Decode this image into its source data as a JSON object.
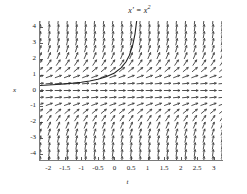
{
  "figure": {
    "title": "x' = x",
    "title_exponent": "2",
    "xlabel": "t",
    "ylabel": "x",
    "background_color": "#ffffff",
    "axis_color": "#7a7a7a",
    "arrow_color": "#3c3c3c",
    "curve_color": "#222222"
  },
  "chart_data": {
    "type": "line",
    "xlabel": "t",
    "ylabel": "x",
    "plot_kind": "direction-field-with-solution-curve",
    "equation": "x' = x^2",
    "xlim": [
      -2.25,
      3.25
    ],
    "ylim": [
      -4.4,
      4.4
    ],
    "grid": false,
    "legend": null,
    "xticks": [
      -2,
      -1.5,
      -1,
      -0.5,
      0,
      0.5,
      1,
      1.5,
      2,
      2.5,
      3
    ],
    "xtick_labels": [
      "-2",
      "-1.5",
      "-1",
      "-0.5",
      "0",
      "0.5",
      "1",
      "1.5",
      "2",
      "2.5",
      "3"
    ],
    "yticks": [
      4,
      3,
      2,
      1,
      0,
      -1,
      -2,
      -3,
      -4
    ],
    "ytick_labels": [
      "4",
      "3",
      "2",
      "1",
      "0",
      "-1",
      "-2",
      "-3",
      "-4"
    ],
    "vector_field": {
      "slope_formula": "dx/dt = x^2",
      "grid_nx": 21,
      "grid_ny": 21,
      "x_start": -2.25,
      "x_end": 3.25,
      "y_start": -4.4,
      "y_end": 4.4,
      "arrow_pixel_length": 7,
      "arrowhead": true,
      "description": "Arrows all point right-and-up (slope x^2 >= 0); nearly horizontal near x=0, steeply vertical for large |x|."
    },
    "series": [
      {
        "name": "solution curve",
        "formula": "x(t) = 1/(0.9 - t)",
        "blowup_t": 0.9,
        "x": [
          -2.25,
          -2.0,
          -1.75,
          -1.5,
          -1.25,
          -1.0,
          -0.75,
          -0.5,
          -0.25,
          0.0,
          0.2,
          0.35,
          0.45,
          0.55,
          0.62,
          0.68,
          0.72,
          0.76,
          0.79,
          0.81,
          0.83
        ],
        "y": [
          0.317,
          0.345,
          0.377,
          0.417,
          0.465,
          0.526,
          0.606,
          0.714,
          0.87,
          1.111,
          1.429,
          1.818,
          2.222,
          2.857,
          3.571,
          4.545,
          5.556,
          7.143,
          9.091,
          11.11,
          14.29
        ]
      }
    ]
  }
}
